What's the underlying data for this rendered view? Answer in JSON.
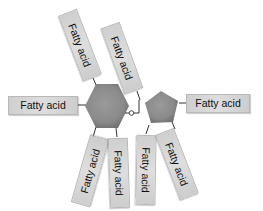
{
  "diagram": {
    "type": "triglyceride-like sugar ester (disaccharide with fatty acid chains)",
    "core": {
      "hexagon": {
        "label": "",
        "color": "#8e8e8e"
      },
      "pentagon": {
        "label": "",
        "color": "#8e8e8e"
      },
      "linkage": {
        "symbol": "o",
        "description": "glycosidic oxygen linking hexagon and pentagon"
      }
    },
    "fatty_acids": [
      {
        "id": "fa-left",
        "label": "Fatty acid",
        "attached_to": "hexagon"
      },
      {
        "id": "fa-top-left",
        "label": "Fatty acid",
        "attached_to": "hexagon"
      },
      {
        "id": "fa-top-middle",
        "label": "Fatty acid",
        "attached_to": "pentagon"
      },
      {
        "id": "fa-right",
        "label": "Fatty acid",
        "attached_to": "pentagon"
      },
      {
        "id": "fa-bottom-1",
        "label": "Fatty acid",
        "attached_to": "hexagon"
      },
      {
        "id": "fa-bottom-2",
        "label": "Fatty acid",
        "attached_to": "hexagon"
      },
      {
        "id": "fa-bottom-3",
        "label": "Fatty acid",
        "attached_to": "pentagon"
      },
      {
        "id": "fa-bottom-4",
        "label": "Fatty acid",
        "attached_to": "pentagon"
      }
    ],
    "colors": {
      "ring_fill": "#8e8e8e",
      "box_fill": "#d6d6d6",
      "box_border": "#b8b8b8",
      "line": "#333333",
      "text": "#111111"
    }
  }
}
